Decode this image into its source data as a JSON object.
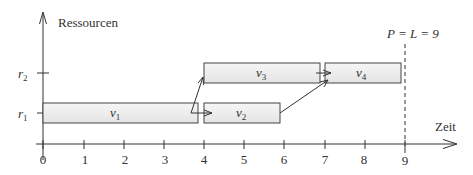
{
  "diagram": {
    "type": "gantt-schedule",
    "y_axis_label": "Ressourcen",
    "x_axis_label": "Zeit",
    "x_ticks": [
      "0",
      "1",
      "2",
      "3",
      "4",
      "5",
      "6",
      "7",
      "8",
      "9"
    ],
    "resources": [
      {
        "id": "r1",
        "label": "r",
        "sub": "1"
      },
      {
        "id": "r2",
        "label": "r",
        "sub": "2"
      }
    ],
    "tasks": [
      {
        "id": "v1",
        "label": "v",
        "sub": "1",
        "resource": "r1",
        "start": 0,
        "end": 3.9
      },
      {
        "id": "v2",
        "label": "v",
        "sub": "2",
        "resource": "r1",
        "start": 4,
        "end": 5.9
      },
      {
        "id": "v3",
        "label": "v",
        "sub": "3",
        "resource": "r2",
        "start": 4,
        "end": 6.9
      },
      {
        "id": "v4",
        "label": "v",
        "sub": "4",
        "resource": "r2",
        "start": 7,
        "end": 8.9
      }
    ],
    "dependencies": [
      {
        "from": "v1",
        "to": "v3"
      },
      {
        "from": "v1",
        "to": "v2"
      },
      {
        "from": "v2",
        "to": "v4"
      },
      {
        "from": "v3",
        "to": "v4"
      }
    ],
    "deadline": {
      "x": 9,
      "label": "P = L = 9"
    },
    "colors": {
      "bar_fill": "#efefef",
      "bar_stroke": "#444444",
      "axis": "#333333",
      "deadline": "#555555"
    }
  }
}
